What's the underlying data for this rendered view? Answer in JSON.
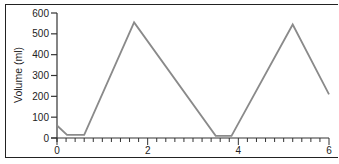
{
  "chart_data": {
    "type": "line",
    "title": "",
    "xlabel": "",
    "ylabel": "Volume (ml)",
    "xlim": [
      0,
      6
    ],
    "ylim": [
      0,
      600
    ],
    "x_ticks": [
      "0",
      "2",
      "4",
      "6"
    ],
    "y_ticks": [
      "0",
      "100",
      "200",
      "300",
      "400",
      "500",
      "600"
    ],
    "grid": false,
    "legend": null,
    "series": [
      {
        "name": "Volume",
        "color": "#8a8a8a",
        "x": [
          0,
          0.22,
          0.6,
          1.7,
          3.5,
          3.85,
          5.2,
          6.0
        ],
        "y": [
          60,
          15,
          15,
          555,
          10,
          10,
          545,
          210
        ]
      }
    ]
  }
}
